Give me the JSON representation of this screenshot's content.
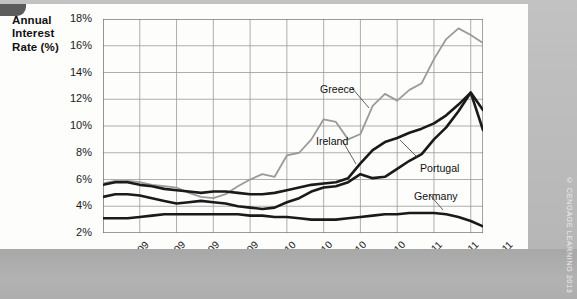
{
  "figure": {
    "axis_title": "Annual Interest Rate (%)",
    "credit": "© CENGAGE LEARNING 2013"
  },
  "chart_data": {
    "type": "line",
    "title": "",
    "xlabel": "",
    "ylabel": "Annual Interest Rate (%)",
    "ylim": [
      2,
      18
    ],
    "yticks": [
      "2%",
      "4%",
      "6%",
      "8%",
      "10%",
      "12%",
      "14%",
      "16%",
      "18%"
    ],
    "ytick_values": [
      2,
      4,
      6,
      8,
      10,
      12,
      14,
      16,
      18
    ],
    "xticks": [
      "Jan-09",
      "Apr-09",
      "Jul-09",
      "Oct-09",
      "Jan-10",
      "Apr-10",
      "Jul-10",
      "Oct-10",
      "Jan-11",
      "Apr-11",
      "Jul-11"
    ],
    "grid": true,
    "legend_position": "inline-annotations",
    "x": [
      "Jan-09",
      "Feb-09",
      "Mar-09",
      "Apr-09",
      "May-09",
      "Jun-09",
      "Jul-09",
      "Aug-09",
      "Sep-09",
      "Oct-09",
      "Nov-09",
      "Dec-09",
      "Jan-10",
      "Feb-10",
      "Mar-10",
      "Apr-10",
      "May-10",
      "Jun-10",
      "Jul-10",
      "Aug-10",
      "Sep-10",
      "Oct-10",
      "Nov-10",
      "Dec-10",
      "Jan-11",
      "Feb-11",
      "Mar-11",
      "Apr-11",
      "May-11",
      "Jun-11",
      "Jul-11",
      "Aug-11"
    ],
    "series": [
      {
        "name": "Greece",
        "color": "#9a9a9a",
        "width": 1.8,
        "values": [
          5.7,
          5.9,
          5.9,
          5.8,
          5.6,
          5.5,
          5.4,
          5.0,
          4.7,
          4.6,
          4.9,
          5.5,
          6.0,
          6.4,
          6.2,
          7.8,
          8.0,
          9.0,
          10.5,
          10.3,
          9.0,
          9.4,
          11.5,
          12.4,
          11.9,
          12.7,
          13.2,
          15.0,
          16.5,
          17.3,
          16.8,
          16.2
        ]
      },
      {
        "name": "Ireland",
        "color": "#1a1a1a",
        "width": 2.6,
        "values": [
          5.6,
          5.8,
          5.8,
          5.6,
          5.5,
          5.3,
          5.2,
          5.1,
          5.0,
          5.1,
          5.1,
          5.0,
          4.9,
          4.9,
          5.0,
          5.2,
          5.4,
          5.6,
          5.7,
          5.8,
          6.1,
          7.2,
          8.2,
          8.8,
          9.1,
          9.5,
          9.8,
          10.2,
          10.8,
          11.6,
          12.5,
          9.7
        ]
      },
      {
        "name": "Portugal",
        "color": "#1a1a1a",
        "width": 2.6,
        "values": [
          4.7,
          4.9,
          4.9,
          4.8,
          4.6,
          4.4,
          4.2,
          4.3,
          4.4,
          4.3,
          4.2,
          4.0,
          3.9,
          3.8,
          3.9,
          4.3,
          4.6,
          5.1,
          5.4,
          5.5,
          5.8,
          6.4,
          6.1,
          6.2,
          6.8,
          7.4,
          7.9,
          9.0,
          9.9,
          11.1,
          12.5,
          11.2
        ]
      },
      {
        "name": "Germany",
        "color": "#1a1a1a",
        "width": 2.6,
        "values": [
          3.1,
          3.1,
          3.1,
          3.2,
          3.3,
          3.4,
          3.4,
          3.4,
          3.4,
          3.4,
          3.4,
          3.4,
          3.3,
          3.3,
          3.2,
          3.2,
          3.1,
          3.0,
          3.0,
          3.0,
          3.1,
          3.2,
          3.3,
          3.4,
          3.4,
          3.5,
          3.5,
          3.5,
          3.4,
          3.2,
          2.9,
          2.5
        ]
      }
    ],
    "annotations": [
      {
        "text": "Greece",
        "x_px": 320,
        "y_px": 79
      },
      {
        "text": "Ireland",
        "x_px": 316,
        "y_px": 131
      },
      {
        "text": "Portugal",
        "x_px": 420,
        "y_px": 158
      },
      {
        "text": "Germany",
        "x_px": 414,
        "y_px": 186
      }
    ]
  }
}
